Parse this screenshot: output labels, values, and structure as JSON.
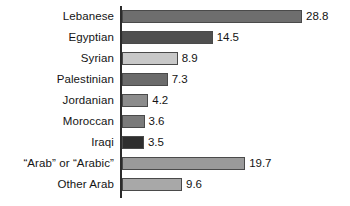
{
  "chart_data": {
    "type": "bar",
    "orientation": "horizontal",
    "title": "",
    "subtitle": "",
    "xlabel": "",
    "ylabel": "",
    "grid": false,
    "legend": "none",
    "xlim": [
      0,
      28.8
    ],
    "axis_line": true,
    "categories": [
      "Lebanese",
      "Egyptian",
      "Syrian",
      "Palestinian",
      "Jordanian",
      "Moroccan",
      "Iraqi",
      "“Arab” or “Arabic”",
      "Other Arab"
    ],
    "values": [
      28.8,
      14.5,
      8.9,
      7.3,
      4.2,
      3.6,
      3.5,
      19.7,
      9.6
    ],
    "value_labels": [
      "28.8",
      "14.5",
      "8.9",
      "7.3",
      "4.2",
      "3.6",
      "3.5",
      "19.7",
      "9.6"
    ],
    "bar_colors": [
      "#6e6e6e",
      "#4f4f4f",
      "#c8c8c8",
      "#6b6b6b",
      "#8c8c8c",
      "#7a7a7a",
      "#2e2e2e",
      "#9a9a9a",
      "#a8a8a8"
    ],
    "bar_border_color": "#4a4a4a",
    "axis_color": "#2b2b2b",
    "text_color": "#141414",
    "background": "#ffffff"
  }
}
